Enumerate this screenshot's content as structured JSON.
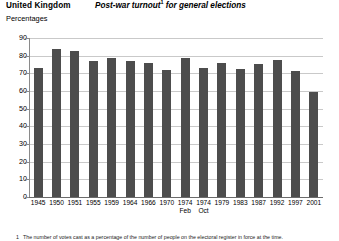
{
  "header": {
    "region": "United Kingdom",
    "title": "Post-war turnout",
    "title_footnote_marker": "1",
    "title_tail": " for general elections",
    "units": "Percentages"
  },
  "footnote": {
    "marker": "1",
    "text": "The number of votes cast as a percentage of the number of people on the electoral register in force at the time."
  },
  "style": {
    "bar_color": "#4d4d4d",
    "grid_color": "#c9c9c9",
    "axis_color": "#8a8a8a",
    "background": "#ffffff"
  },
  "chart_data": {
    "type": "bar",
    "subtitle": "United Kingdom",
    "xlabel": "",
    "ylabel": "Percentages",
    "ylim": [
      0,
      90
    ],
    "yticks": [
      0,
      10,
      20,
      30,
      40,
      50,
      60,
      70,
      80,
      90
    ],
    "ytick_labels": [
      "0",
      "10",
      "20",
      "30",
      "40",
      "50",
      "60",
      "70",
      "80",
      "90"
    ],
    "grid": true,
    "legend": "none",
    "categories": [
      "1945",
      "1950",
      "1951",
      "1955",
      "1959",
      "1964",
      "1966",
      "1970",
      "1974",
      "1974",
      "1979",
      "1983",
      "1987",
      "1992",
      "1997",
      "2001"
    ],
    "category_sublabels": [
      "",
      "",
      "",
      "",
      "",
      "",
      "",
      "",
      "Feb",
      "Oct",
      "",
      "",
      "",
      "",
      "",
      ""
    ],
    "values": [
      72.8,
      83.9,
      82.6,
      76.8,
      78.7,
      77.1,
      75.8,
      72.0,
      78.8,
      72.8,
      76.0,
      72.7,
      75.3,
      77.7,
      71.4,
      59.4
    ]
  }
}
